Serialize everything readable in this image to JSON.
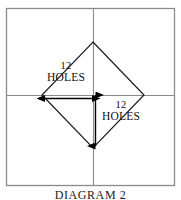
{
  "figure": {
    "caption": "DIAGRAM 2",
    "frame": {
      "x": 6,
      "y": 8,
      "width": 169,
      "height": 178,
      "stroke_color": "#8a8a8a"
    },
    "centerlines": {
      "horizontal_y": 95,
      "vertical_x": 93,
      "stroke_color": "#8a8a8a"
    },
    "diamond": {
      "top": [
        93,
        42
      ],
      "right": [
        144,
        95
      ],
      "bottom": [
        93,
        148
      ],
      "left": [
        42,
        95
      ],
      "stroke_color": "#1a1a1a"
    },
    "dimensions": [
      {
        "name": "horizontal-dimension",
        "label_number": "12",
        "label_word": "HOLES",
        "orientation": "horizontal",
        "from": [
          44,
          98
        ],
        "to": [
          93,
          98
        ],
        "arrow_color": "#000000"
      },
      {
        "name": "vertical-dimension",
        "label_number": "12",
        "label_word": "HOLES",
        "orientation": "vertical",
        "from": [
          96,
          94
        ],
        "to": [
          96,
          147
        ],
        "arrow_color": "#000000"
      }
    ]
  }
}
